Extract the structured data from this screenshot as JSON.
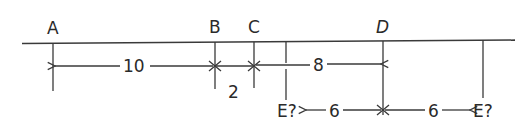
{
  "diagram": {
    "type": "number-line-distance-problem",
    "points": [
      {
        "label": "A",
        "x": 53
      },
      {
        "label": "B",
        "x": 215
      },
      {
        "label": "C",
        "x": 254
      },
      {
        "label": "D",
        "x": 383
      }
    ],
    "candidates": [
      {
        "label": "E?",
        "x": 286,
        "side": "left of D"
      },
      {
        "label": "E?",
        "x": 483,
        "side": "right of D"
      }
    ],
    "distances": [
      {
        "from": "A",
        "to": "B",
        "value": "10"
      },
      {
        "from": "B",
        "to": "C",
        "value": "2"
      },
      {
        "from": "C",
        "to": "D",
        "value": "8"
      },
      {
        "from": "E?",
        "to": "D",
        "value": "6"
      },
      {
        "from": "D",
        "to": "E?",
        "value": "6"
      }
    ]
  }
}
